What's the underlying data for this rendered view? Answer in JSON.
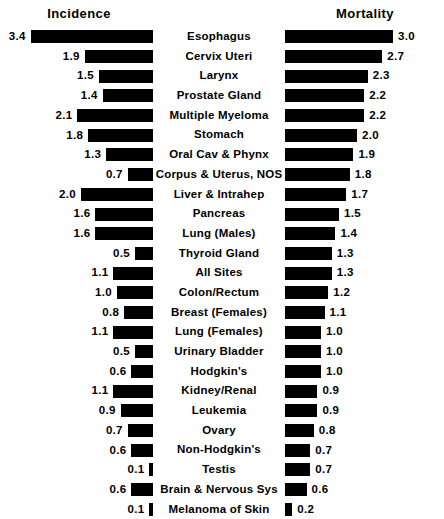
{
  "chart_data": {
    "type": "bar",
    "title": "",
    "subtitle": "",
    "layout": "paired-horizontal-bar (bidirectional, shared category axis in center)",
    "panels": [
      {
        "name": "incidence",
        "header": "Incidence",
        "direction": "right-to-left",
        "xlabel": "",
        "ylabel": "",
        "xlim": [
          0,
          3.4
        ],
        "grid": false
      },
      {
        "name": "mortality",
        "header": "Mortality",
        "direction": "left-to-right",
        "xlabel": "",
        "ylabel": "",
        "xlim": [
          0,
          3.0
        ],
        "grid": false
      }
    ],
    "legend": null,
    "px_per_unit": 36,
    "categories": [
      "Esophagus",
      "Cervix Uteri",
      "Larynx",
      "Prostate Gland",
      "Multiple Myeloma",
      "Stomach",
      "Oral Cav & Phynx",
      "Corpus & Uterus, NOS",
      "Liver & Intrahep",
      "Pancreas",
      "Lung (Males)",
      "Thyroid Gland",
      "All Sites",
      "Colon/Rectum",
      "Breast (Females)",
      "Lung (Females)",
      "Urinary Bladder",
      "Hodgkin's",
      "Kidney/Renal",
      "Leukemia",
      "Ovary",
      "Non-Hodgkin's",
      "Testis",
      "Brain & Nervous Sys",
      "Melanoma of Skin"
    ],
    "series": [
      {
        "name": "Incidence",
        "values": [
          3.4,
          1.9,
          1.5,
          1.4,
          2.1,
          1.8,
          1.3,
          0.7,
          2.0,
          1.6,
          1.6,
          0.5,
          1.1,
          1.0,
          0.8,
          1.1,
          0.5,
          0.6,
          1.1,
          0.9,
          0.7,
          0.6,
          0.1,
          0.6,
          0.1
        ]
      },
      {
        "name": "Mortality",
        "values": [
          3.0,
          2.7,
          2.3,
          2.2,
          2.2,
          2.0,
          1.9,
          1.8,
          1.7,
          1.5,
          1.4,
          1.3,
          1.3,
          1.2,
          1.1,
          1.0,
          1.0,
          1.0,
          0.9,
          0.9,
          0.8,
          0.7,
          0.7,
          0.6,
          0.2
        ]
      }
    ],
    "rows": [
      {
        "label": "Esophagus",
        "incidence": "3.4",
        "incidence_value": 3.4,
        "mortality": "3.0",
        "mortality_value": 3.0
      },
      {
        "label": "Cervix Uteri",
        "incidence": "1.9",
        "incidence_value": 1.9,
        "mortality": "2.7",
        "mortality_value": 2.7
      },
      {
        "label": "Larynx",
        "incidence": "1.5",
        "incidence_value": 1.5,
        "mortality": "2.3",
        "mortality_value": 2.3
      },
      {
        "label": "Prostate Gland",
        "incidence": "1.4",
        "incidence_value": 1.4,
        "mortality": "2.2",
        "mortality_value": 2.2
      },
      {
        "label": "Multiple Myeloma",
        "incidence": "2.1",
        "incidence_value": 2.1,
        "mortality": "2.2",
        "mortality_value": 2.2
      },
      {
        "label": "Stomach",
        "incidence": "1.8",
        "incidence_value": 1.8,
        "mortality": "2.0",
        "mortality_value": 2.0
      },
      {
        "label": "Oral Cav & Phynx",
        "incidence": "1.3",
        "incidence_value": 1.3,
        "mortality": "1.9",
        "mortality_value": 1.9
      },
      {
        "label": "Corpus & Uterus, NOS",
        "incidence": "0.7",
        "incidence_value": 0.7,
        "mortality": "1.8",
        "mortality_value": 1.8
      },
      {
        "label": "Liver & Intrahep",
        "incidence": "2.0",
        "incidence_value": 2.0,
        "mortality": "1.7",
        "mortality_value": 1.7
      },
      {
        "label": "Pancreas",
        "incidence": "1.6",
        "incidence_value": 1.6,
        "mortality": "1.5",
        "mortality_value": 1.5
      },
      {
        "label": "Lung (Males)",
        "incidence": "1.6",
        "incidence_value": 1.6,
        "mortality": "1.4",
        "mortality_value": 1.4
      },
      {
        "label": "Thyroid Gland",
        "incidence": "0.5",
        "incidence_value": 0.5,
        "mortality": "1.3",
        "mortality_value": 1.3
      },
      {
        "label": "All Sites",
        "incidence": "1.1",
        "incidence_value": 1.1,
        "mortality": "1.3",
        "mortality_value": 1.3
      },
      {
        "label": "Colon/Rectum",
        "incidence": "1.0",
        "incidence_value": 1.0,
        "mortality": "1.2",
        "mortality_value": 1.2
      },
      {
        "label": "Breast (Females)",
        "incidence": "0.8",
        "incidence_value": 0.8,
        "mortality": "1.1",
        "mortality_value": 1.1
      },
      {
        "label": "Lung (Females)",
        "incidence": "1.1",
        "incidence_value": 1.1,
        "mortality": "1.0",
        "mortality_value": 1.0
      },
      {
        "label": "Urinary Bladder",
        "incidence": "0.5",
        "incidence_value": 0.5,
        "mortality": "1.0",
        "mortality_value": 1.0
      },
      {
        "label": "Hodgkin's",
        "incidence": "0.6",
        "incidence_value": 0.6,
        "mortality": "1.0",
        "mortality_value": 1.0
      },
      {
        "label": "Kidney/Renal",
        "incidence": "1.1",
        "incidence_value": 1.1,
        "mortality": "0.9",
        "mortality_value": 0.9
      },
      {
        "label": "Leukemia",
        "incidence": "0.9",
        "incidence_value": 0.9,
        "mortality": "0.9",
        "mortality_value": 0.9
      },
      {
        "label": "Ovary",
        "incidence": "0.7",
        "incidence_value": 0.7,
        "mortality": "0.8",
        "mortality_value": 0.8
      },
      {
        "label": "Non-Hodgkin's",
        "incidence": "0.6",
        "incidence_value": 0.6,
        "mortality": "0.7",
        "mortality_value": 0.7
      },
      {
        "label": "Testis",
        "incidence": "0.1",
        "incidence_value": 0.1,
        "mortality": "0.7",
        "mortality_value": 0.7
      },
      {
        "label": "Brain & Nervous Sys",
        "incidence": "0.6",
        "incidence_value": 0.6,
        "mortality": "0.6",
        "mortality_value": 0.6
      },
      {
        "label": "Melanoma of Skin",
        "incidence": "0.1",
        "incidence_value": 0.1,
        "mortality": "0.2",
        "mortality_value": 0.2
      }
    ]
  },
  "headers": {
    "incidence": "Incidence",
    "mortality": "Mortality"
  },
  "colors": {
    "bar": "#000000",
    "text": "#000000",
    "background": "#ffffff"
  }
}
